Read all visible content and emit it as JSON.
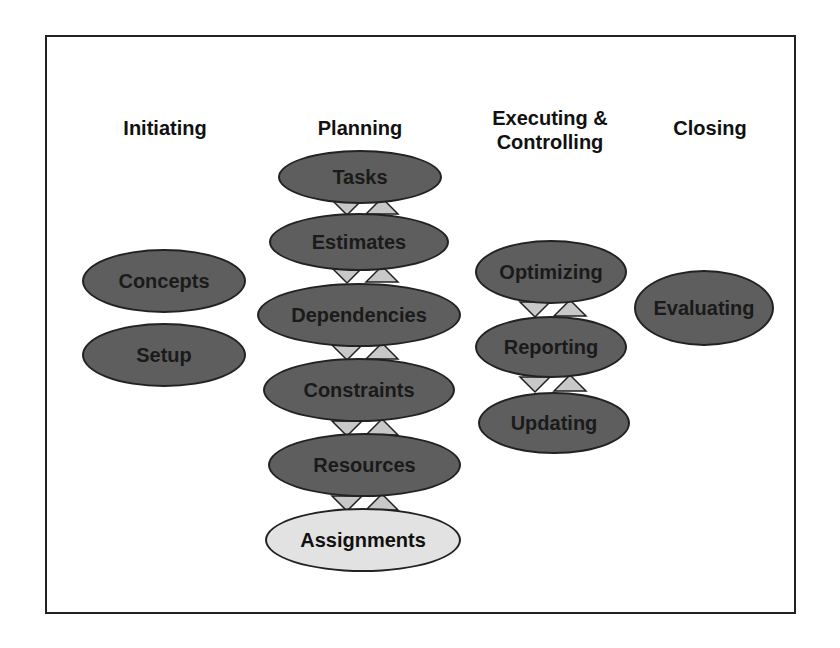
{
  "diagram": {
    "type": "process-flow",
    "columns": [
      {
        "heading": "Initiating",
        "nodes": [
          "Concepts",
          "Setup"
        ]
      },
      {
        "heading": "Planning",
        "nodes": [
          "Tasks",
          "Estimates",
          "Dependencies",
          "Constraints",
          "Resources",
          "Assignments"
        ],
        "highlighted": "Assignments"
      },
      {
        "heading_line1": "Executing &",
        "heading_line2": "Controlling",
        "nodes": [
          "Optimizing",
          "Reporting",
          "Updating"
        ]
      },
      {
        "heading": "Closing",
        "nodes": [
          "Evaluating"
        ]
      }
    ],
    "colors": {
      "node_fill": "#5e5e5e",
      "highlight_fill": "#e2e2e2",
      "connector_fill": "#c8c8c8",
      "outline": "#222222"
    }
  }
}
